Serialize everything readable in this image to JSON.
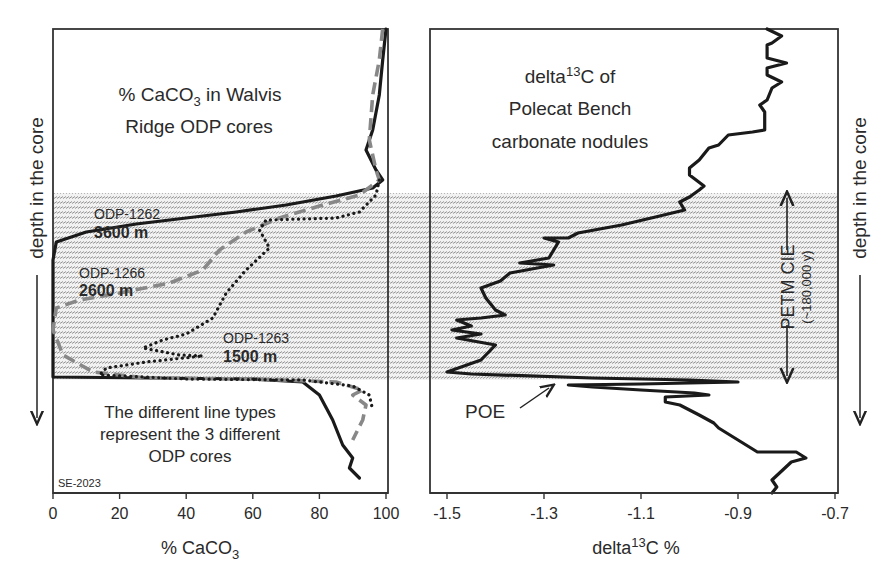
{
  "chart_data": [
    {
      "type": "line",
      "panel": "left",
      "title": "% CaCO3 in Walvis Ridge ODP cores",
      "title_lines": [
        "% CaCO",
        "3",
        " in Walvis",
        "Ridge ODP cores"
      ],
      "xlabel": "% CaCO3",
      "xlabel_parts": [
        "% CaCO",
        "3"
      ],
      "ylabel": "depth in the core",
      "xlim": [
        0,
        100
      ],
      "xticks": [
        "0",
        "20",
        "40",
        "60",
        "80",
        "100"
      ],
      "grid": false,
      "legend_note": [
        "The different line types",
        "represent the 3 different",
        "ODP cores"
      ],
      "credit": "SE-2023",
      "series": [
        {
          "name": "ODP-1262",
          "depth_label": "3600 m",
          "style": "solid",
          "color": "#1a1a1a",
          "points": [
            [
              100,
              29
            ],
            [
              99,
              60
            ],
            [
              98,
              95
            ],
            [
              96,
              130
            ],
            [
              94,
              150
            ],
            [
              97,
              170
            ],
            [
              99,
              180
            ],
            [
              96,
              188
            ],
            [
              85,
              196
            ],
            [
              70,
              205
            ],
            [
              55,
              212
            ],
            [
              40,
              218
            ],
            [
              25,
              224
            ],
            [
              10,
              232
            ],
            [
              1,
              242
            ],
            [
              0,
              260
            ],
            [
              0,
              300
            ],
            [
              0,
              340
            ],
            [
              0,
              377
            ],
            [
              30,
              378
            ],
            [
              60,
              379
            ],
            [
              75,
              382
            ],
            [
              80,
              395
            ],
            [
              84,
              420
            ],
            [
              87,
              445
            ],
            [
              90,
              458
            ],
            [
              89,
              468
            ],
            [
              92,
              478
            ]
          ]
        },
        {
          "name": "ODP-1266",
          "depth_label": "2600 m",
          "style": "dashed",
          "color": "#888888",
          "points": [
            [
              99,
              29
            ],
            [
              98,
              60
            ],
            [
              96,
              95
            ],
            [
              95,
              140
            ],
            [
              97,
              170
            ],
            [
              98,
              180
            ],
            [
              92,
              195
            ],
            [
              80,
              206
            ],
            [
              68,
              218
            ],
            [
              58,
              232
            ],
            [
              50,
              250
            ],
            [
              45,
              270
            ],
            [
              35,
              283
            ],
            [
              20,
              293
            ],
            [
              8,
              300
            ],
            [
              1,
              308
            ],
            [
              0,
              330
            ],
            [
              3,
              355
            ],
            [
              12,
              372
            ],
            [
              28,
              378
            ],
            [
              60,
              379
            ],
            [
              85,
              382
            ],
            [
              93,
              390
            ],
            [
              90,
              395
            ],
            [
              94,
              405
            ],
            [
              93,
              420
            ],
            [
              90,
              440
            ]
          ]
        },
        {
          "name": "ODP-1263",
          "depth_label": "1500 m",
          "style": "dotted",
          "color": "#1a1a1a",
          "points": [
            [
              98,
              180
            ],
            [
              97,
              195
            ],
            [
              92,
              212
            ],
            [
              85,
              218
            ],
            [
              75,
              219
            ],
            [
              64,
              220
            ],
            [
              62,
              230
            ],
            [
              65,
              248
            ],
            [
              58,
              270
            ],
            [
              52,
              293
            ],
            [
              48,
              318
            ],
            [
              40,
              334
            ],
            [
              33,
              340
            ],
            [
              27,
              348
            ],
            [
              38,
              355
            ],
            [
              45,
              356
            ],
            [
              28,
              362
            ],
            [
              16,
              368
            ],
            [
              14,
              375
            ],
            [
              40,
              379
            ],
            [
              75,
              380
            ],
            [
              90,
              386
            ],
            [
              95,
              395
            ],
            [
              96,
              410
            ]
          ]
        }
      ],
      "labels": [
        {
          "name": "ODP-1262",
          "depth": "3600 m"
        },
        {
          "name": "ODP-1266",
          "depth": "2600 m"
        },
        {
          "name": "ODP-1263",
          "depth": "1500 m"
        }
      ]
    },
    {
      "type": "line",
      "panel": "right",
      "title": "delta13C of Polecat Bench carbonate nodules",
      "title_lines": [
        "delta",
        "13",
        "C of",
        "Polecat Bench",
        "carbonate nodules"
      ],
      "xlabel": "delta13C %",
      "xlabel_parts": [
        "delta",
        "13",
        "C %"
      ],
      "ylabel": "depth in the core",
      "xlim": [
        -1.5,
        -0.7
      ],
      "xticks": [
        "-1.5",
        "-1.3",
        "-1.1",
        "-0.9",
        "-0.7"
      ],
      "grid": false,
      "annotations": {
        "petm": "PETM CIE",
        "petm_duration": "(~180,000 y)",
        "poe": "POE"
      },
      "series": [
        {
          "name": "delta13C",
          "style": "solid",
          "color": "#1a1a1a",
          "points": [
            [
              -0.84,
              29
            ],
            [
              -0.81,
              36
            ],
            [
              -0.83,
              43
            ],
            [
              -0.84,
              45
            ],
            [
              -0.84,
              58
            ],
            [
              -0.8,
              63
            ],
            [
              -0.84,
              68
            ],
            [
              -0.84,
              75
            ],
            [
              -0.81,
              82
            ],
            [
              -0.83,
              88
            ],
            [
              -0.84,
              100
            ],
            [
              -0.855,
              105
            ],
            [
              -0.845,
              112
            ],
            [
              -0.845,
              130
            ],
            [
              -0.87,
              132
            ],
            [
              -0.92,
              135
            ],
            [
              -0.94,
              145
            ],
            [
              -0.96,
              148
            ],
            [
              -0.98,
              160
            ],
            [
              -1.0,
              168
            ],
            [
              -1.0,
              175
            ],
            [
              -0.97,
              186
            ],
            [
              -0.98,
              190
            ],
            [
              -1.0,
              197
            ],
            [
              -1.02,
              202
            ],
            [
              -1.01,
              210
            ],
            [
              -1.07,
              217
            ],
            [
              -1.14,
              225
            ],
            [
              -1.23,
              233
            ],
            [
              -1.25,
              238
            ],
            [
              -1.3,
              238
            ],
            [
              -1.27,
              242
            ],
            [
              -1.29,
              258
            ],
            [
              -1.35,
              263
            ],
            [
              -1.28,
              265
            ],
            [
              -1.37,
              273
            ],
            [
              -1.39,
              281
            ],
            [
              -1.43,
              288
            ],
            [
              -1.42,
              298
            ],
            [
              -1.4,
              310
            ],
            [
              -1.38,
              315
            ],
            [
              -1.43,
              318
            ],
            [
              -1.48,
              320
            ],
            [
              -1.45,
              326
            ],
            [
              -1.49,
              330
            ],
            [
              -1.43,
              334
            ],
            [
              -1.48,
              338
            ],
            [
              -1.4,
              345
            ],
            [
              -1.43,
              360
            ],
            [
              -1.5,
              372
            ],
            [
              -1.45,
              374
            ],
            [
              -1.2,
              378
            ],
            [
              -1.0,
              380
            ],
            [
              -0.9,
              382
            ],
            [
              -1.1,
              384
            ],
            [
              -1.25,
              385
            ],
            [
              -1.2,
              387
            ],
            [
              -1.1,
              390
            ],
            [
              -0.99,
              393
            ],
            [
              -0.96,
              395
            ],
            [
              -1.05,
              397
            ],
            [
              -1.05,
              402
            ],
            [
              -1.02,
              405
            ],
            [
              -0.98,
              415
            ],
            [
              -0.95,
              423
            ],
            [
              -0.94,
              428
            ],
            [
              -0.9,
              440
            ],
            [
              -0.86,
              452
            ],
            [
              -0.78,
              452
            ],
            [
              -0.76,
              458
            ],
            [
              -0.79,
              462
            ],
            [
              -0.83,
              480
            ],
            [
              -0.82,
              487
            ],
            [
              -0.83,
              493
            ]
          ]
        }
      ]
    }
  ],
  "shared": {
    "shaded_band_y": [
      193,
      380
    ],
    "hatch_color": "#9a9a9a",
    "frame_color": "#333333"
  }
}
